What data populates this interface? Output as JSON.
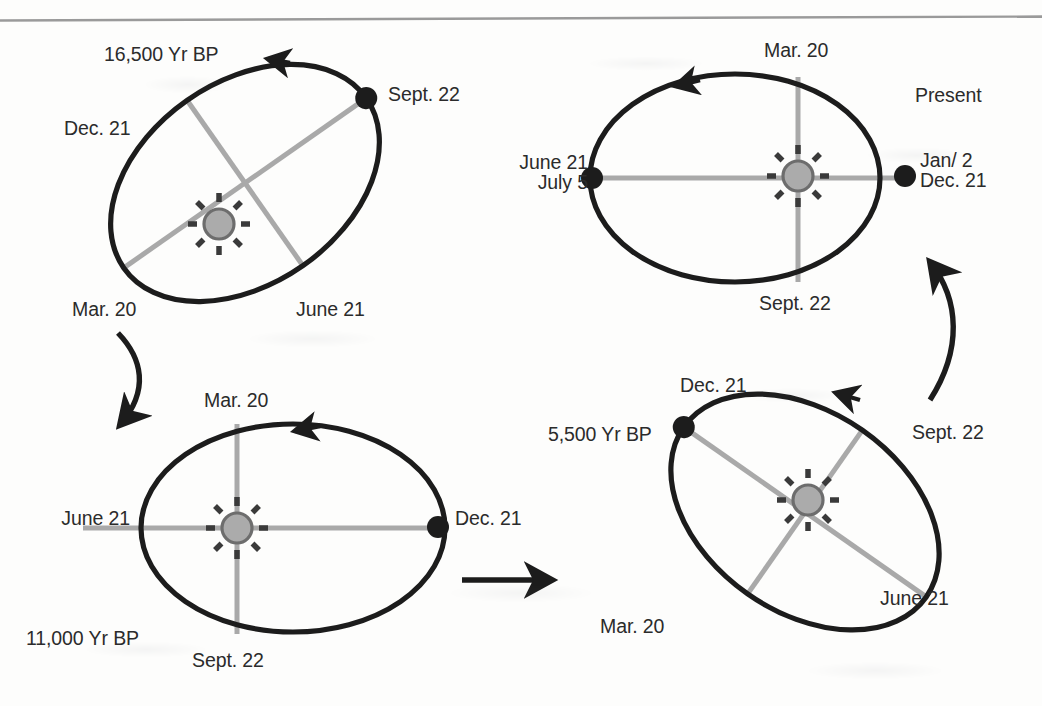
{
  "figure": {
    "kind": "orbital-precession-diagram",
    "panel_count": 4,
    "divider_color": "#9a9a9a",
    "orbit_color": "#1c1c1c",
    "axis_color": "#a9a9a9",
    "sun_fill": "#ababab",
    "sun_stroke": "#6d6d6d",
    "marker_color": "#1c1c1c",
    "text_color": "#2b2b2b",
    "arrow_color": "#1c1c1c"
  },
  "panels": [
    {
      "id": "panel-16500",
      "epoch": "16,500 Yr BP",
      "orbit_rotation_deg": -35,
      "orbit_direction": "counterclockwise",
      "perihelion_event": "Sept. 22",
      "labels": {
        "epoch": "16,500 Yr BP",
        "sept22": "Sept. 22",
        "dec21": "Dec. 21",
        "mar20": "Mar. 20",
        "june21": "June 21"
      }
    },
    {
      "id": "panel-present",
      "epoch": "Present",
      "orbit_rotation_deg": 0,
      "orbit_direction": "counterclockwise",
      "perihelion_event": "Jan/ 2",
      "labels": {
        "epoch": "Present",
        "mar20": "Mar. 20",
        "june21": "June 21",
        "july5": "July 5",
        "jan2": "Jan/ 2",
        "dec21": "Dec. 21",
        "sept22": "Sept. 22"
      }
    },
    {
      "id": "panel-11000",
      "epoch": "11,000 Yr BP",
      "orbit_rotation_deg": 0,
      "orbit_direction": "counterclockwise",
      "perihelion_event": "Dec. 21",
      "labels": {
        "epoch": "11,000 Yr BP",
        "mar20": "Mar. 20",
        "june21": "June 21",
        "dec21": "Dec. 21",
        "sept22": "Sept. 22"
      }
    },
    {
      "id": "panel-5500",
      "epoch": "5,500 Yr BP",
      "orbit_rotation_deg": 35,
      "orbit_direction": "counterclockwise",
      "perihelion_event": "Dec. 21",
      "labels": {
        "epoch": "5,500 Yr BP",
        "dec21": "Dec. 21",
        "sept22": "Sept. 22",
        "mar20": "Mar. 20",
        "june21": "June 21"
      }
    }
  ],
  "flow_arrows": [
    {
      "id": "arrow-16500-to-11000",
      "shape": "curved",
      "from": "panel-16500",
      "to": "panel-11000",
      "direction": "down-left"
    },
    {
      "id": "arrow-11000-to-5500",
      "shape": "straight",
      "from": "panel-11000",
      "to": "panel-5500",
      "direction": "right"
    },
    {
      "id": "arrow-5500-to-present",
      "shape": "curved",
      "from": "panel-5500",
      "to": "panel-present",
      "direction": "up-left"
    }
  ]
}
